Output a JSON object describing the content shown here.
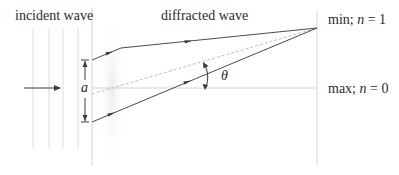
{
  "labels": {
    "incident_wave": "incident wave",
    "diffracted_wave": "diffracted wave",
    "slit_width": "a",
    "angle": "θ",
    "min_prefix": "min; ",
    "min_var": "n",
    "min_suffix": " = 1",
    "max_prefix": "max; ",
    "max_var": "n",
    "max_suffix": " = 0"
  },
  "colors": {
    "line": "#4a4a4a",
    "faint_line": "#d8d8d8",
    "dashed": "#b8b8b8",
    "lens_glow": "#eeeeee"
  },
  "geometry": {
    "incident_wavefronts_x": [
      33,
      49,
      63,
      78
    ],
    "barrier_x": 92,
    "screen_x": 317,
    "slit_top_y": 60,
    "slit_bottom_y": 122,
    "center_y": 88,
    "min_point_y": 28
  }
}
